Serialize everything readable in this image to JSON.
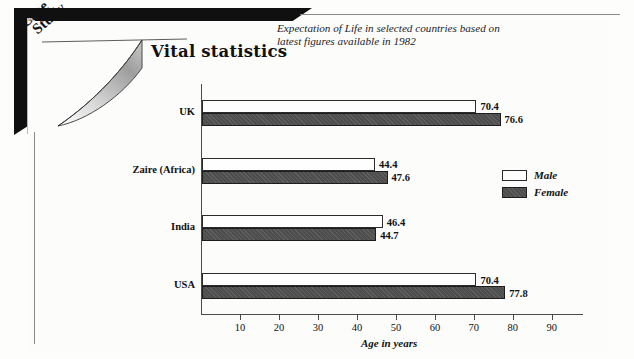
{
  "card": {
    "badge_line1": "Case",
    "badge_line2": "Study"
  },
  "chart": {
    "title": "Vital statistics",
    "subtitle": "Expectation of Life in selected countries based on latest figures available in 1982"
  },
  "legend": {
    "items": [
      {
        "label": "Male",
        "swatch": "white-square-icon",
        "color": "#fefefe"
      },
      {
        "label": "Female",
        "swatch": "dark-square-icon",
        "color": "#4d4d4d"
      }
    ]
  },
  "chart_data": {
    "type": "bar",
    "orientation": "horizontal",
    "title": "Vital statistics",
    "subtitle": "Expectation of Life in selected countries based on latest figures available in 1982",
    "categories": [
      "UK",
      "Zaire (Africa)",
      "India",
      "USA"
    ],
    "series": [
      {
        "name": "Male",
        "values": [
          70.4,
          44.4,
          46.4,
          70.4
        ]
      },
      {
        "name": "Female",
        "values": [
          76.6,
          47.6,
          44.7,
          77.8
        ]
      }
    ],
    "xlabel": "Age in years",
    "ylabel": "",
    "xlim": [
      0,
      98
    ],
    "xticks": [
      10,
      20,
      30,
      40,
      50,
      60,
      70,
      80,
      90
    ],
    "xtick_labels": [
      "10",
      "20",
      "30",
      "40",
      "50",
      "60",
      "70",
      "80",
      "90"
    ],
    "grid": false,
    "legend_position": "right",
    "data_labels": [
      {
        "category": "UK",
        "series": "Male",
        "label": "70.4"
      },
      {
        "category": "UK",
        "series": "Female",
        "label": "76.6"
      },
      {
        "category": "Zaire (Africa)",
        "series": "Male",
        "label": "44.4"
      },
      {
        "category": "Zaire (Africa)",
        "series": "Female",
        "label": "47.6"
      },
      {
        "category": "India",
        "series": "Male",
        "label": "46.4"
      },
      {
        "category": "India",
        "series": "Female",
        "label": "44.7"
      },
      {
        "category": "USA",
        "series": "Male",
        "label": "70.4"
      },
      {
        "category": "USA",
        "series": "Female",
        "label": "77.8"
      }
    ]
  }
}
